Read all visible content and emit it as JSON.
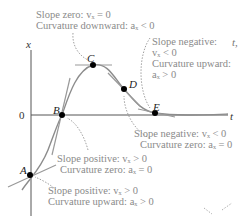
{
  "diagram": {
    "axes": {
      "y_label": "x",
      "x_label": "t",
      "origin_label": "0",
      "side_label": "t,"
    },
    "points": [
      {
        "id": "A",
        "label": "A"
      },
      {
        "id": "B",
        "label": "B"
      },
      {
        "id": "C",
        "label": "C"
      },
      {
        "id": "D",
        "label": "D"
      },
      {
        "id": "E",
        "label": "E"
      }
    ],
    "annotations": {
      "C": {
        "line1": "Slope zero: vₓ = 0",
        "line2": "Curvature downward: aₓ < 0"
      },
      "E": {
        "line1": "Slope negative:",
        "line2": "vₓ < 0",
        "line3": "Curvature upward:",
        "line4": "aₓ > 0"
      },
      "D": {
        "line1": "Slope negative: vₓ < 0",
        "line2": "Curvature zero: aₓ = 0"
      },
      "B": {
        "line1": "Slope positive: vₓ > 0",
        "line2": "Curvature zero: aₓ = 0"
      },
      "A": {
        "line1": "Slope positive: vₓ > 0",
        "line2": "Curvature upward: aₓ > 0"
      }
    },
    "colors": {
      "curve": "#8c8c8c",
      "axis": "#444444",
      "text": "#8a8a8a",
      "point": "#000000"
    }
  }
}
